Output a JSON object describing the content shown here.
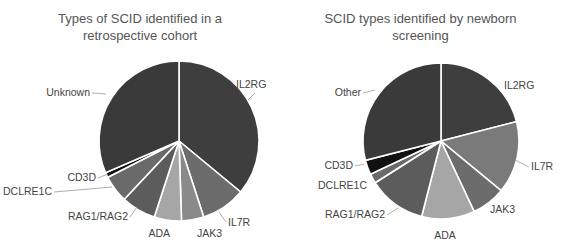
{
  "chart_data": [
    {
      "type": "pie",
      "title": "Types of SCID identified in a retrospective cohort",
      "title_lines": [
        "Types of SCID identified in a",
        "retrospective cohort"
      ],
      "categories": [
        "IL2RG",
        "IL7R",
        "JAK3",
        "ADA",
        "RAG1/RAG2",
        "DCLRE1C",
        "CD3D",
        "Unknown"
      ],
      "values": [
        36,
        9,
        4.5,
        5.5,
        7,
        5.5,
        1,
        31.5
      ],
      "colors": [
        "#3e3e3e",
        "#6c6c6c",
        "#8a8a8a",
        "#a6a6a6",
        "#5c5c5c",
        "#6a6a6a",
        "#111111",
        "#3a3a3a"
      ],
      "units": "percent (estimated)"
    },
    {
      "type": "pie",
      "title": "SCID types identified by newborn screening",
      "title_lines": [
        "SCID types identified by newborn",
        "screening"
      ],
      "categories": [
        "IL2RG",
        "IL7R",
        "JAK3",
        "ADA",
        "RAG1/RAG2",
        "DCLRE1C",
        "CD3D",
        "Other"
      ],
      "values": [
        21,
        15,
        7,
        11,
        12,
        2,
        3,
        29
      ],
      "colors": [
        "#3e3e3e",
        "#7a7a7a",
        "#6c6c6c",
        "#a6a6a6",
        "#5c5c5c",
        "#6a6a6a",
        "#111111",
        "#3a3a3a"
      ],
      "units": "percent (estimated)"
    }
  ]
}
